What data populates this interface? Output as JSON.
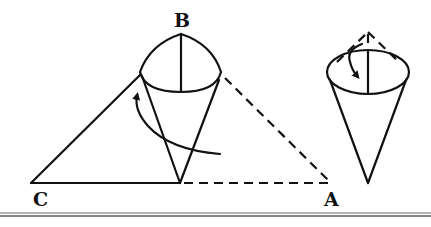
{
  "figure": {
    "labels": {
      "B": "B",
      "C": "C",
      "A": "A"
    },
    "left_figure": {
      "name": "triangle with partially rolled cone",
      "vertices": {
        "B": [
          181,
          34
        ],
        "C": [
          31,
          183
        ],
        "A": [
          331,
          183
        ],
        "fold_point": [
          180,
          183
        ]
      },
      "solid_edges": [
        "C-fold_point",
        "C-cone_rim_left"
      ],
      "dashed_edges": [
        "fold_point-A",
        "cone_rim_right-A"
      ],
      "arrow": "curved arrow indicating rolling direction (counter-clockwise upward)"
    },
    "right_figure": {
      "name": "completed cone with dashed tip folded inward",
      "apex_dashed": [
        368,
        32
      ],
      "tip": [
        368,
        183
      ],
      "arrow": "curved arrow indicating folding the top point down into the cone"
    },
    "colors": {
      "stroke": "#111111",
      "background": "#ffffff",
      "separator": "#9a9a9a"
    }
  }
}
